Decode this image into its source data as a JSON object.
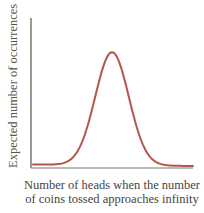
{
  "chart_data": {
    "type": "line",
    "title": "",
    "xlabel_line1": "Number of heads when the number",
    "xlabel_line2": "of coins tossed approaches infinity",
    "ylabel": "Expected number of occurrences",
    "x": [
      0,
      0.1,
      0.2,
      0.25,
      0.3,
      0.35,
      0.4,
      0.45,
      0.5,
      0.55,
      0.6,
      0.65,
      0.7,
      0.75,
      0.8,
      0.9,
      1.0
    ],
    "values": [
      0.01,
      0.02,
      0.05,
      0.1,
      0.2,
      0.38,
      0.62,
      0.88,
      1.0,
      0.88,
      0.62,
      0.38,
      0.2,
      0.1,
      0.05,
      0.02,
      0.01
    ],
    "xlim": [
      0,
      1
    ],
    "ylim": [
      0,
      1.1
    ],
    "grid": false,
    "legend": null,
    "colors": {
      "curve": "#b0584a",
      "axis": "#444444",
      "text": "#4a4a4a"
    }
  }
}
